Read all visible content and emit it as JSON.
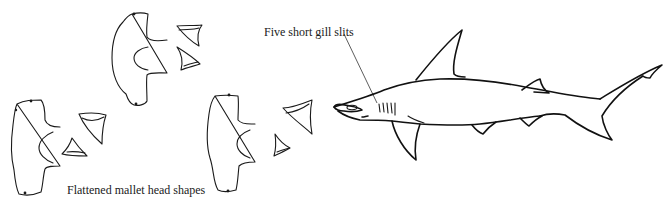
{
  "diagram": {
    "labels": {
      "gill_slits": "Five short gill slits",
      "head_shapes": "Flattened mallet head shapes"
    },
    "head_views": [
      {
        "id": "head-top",
        "teeth_count": 2
      },
      {
        "id": "head-left",
        "teeth_count": 2
      },
      {
        "id": "head-middle",
        "teeth_count": 2
      }
    ],
    "shark_body": {
      "gill_slits_count": 5,
      "fins": [
        "first-dorsal",
        "second-dorsal",
        "pectoral",
        "pelvic",
        "anal",
        "caudal"
      ]
    },
    "colors": {
      "ink": "#1a1a1a",
      "background": "#ffffff"
    }
  }
}
